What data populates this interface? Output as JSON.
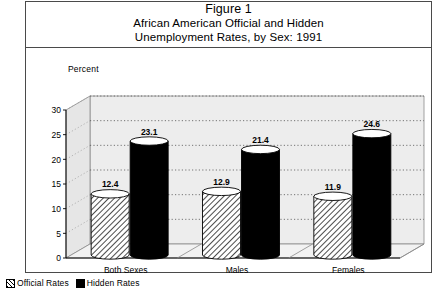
{
  "figure": {
    "title_line1": "Figure 1",
    "title_line2": "African American Official and Hidden",
    "title_line3": "Unemployment Rates, by Sex: 1991"
  },
  "axis": {
    "y_caption": "Percent"
  },
  "legend": {
    "items": [
      {
        "label": "Official Rates",
        "swatch": "hatched-swatch-icon",
        "color": "#000000"
      },
      {
        "label": "Hidden Rates",
        "swatch": "solid-black-swatch-icon",
        "color": "#000000"
      }
    ]
  },
  "chart_data": {
    "type": "bar",
    "title": "African American Official and Hidden Unemployment Rates, by Sex: 1991",
    "categories": [
      "Both Sexes",
      "Males",
      "Females"
    ],
    "series": [
      {
        "name": "Official Rates",
        "values": [
          12.4,
          12.9,
          11.9
        ]
      },
      {
        "name": "Hidden Rates",
        "values": [
          23.1,
          21.4,
          24.6
        ]
      }
    ],
    "xlabel": "",
    "ylabel": "Percent",
    "ylim": [
      0,
      30
    ],
    "yticks": [
      0,
      5,
      10,
      15,
      20,
      25,
      30
    ],
    "ytick_labels": [
      "0",
      "5",
      "10",
      "15",
      "20",
      "25",
      "30"
    ],
    "grid": true,
    "grid_style": "dotted",
    "legend_position": "below-figure",
    "style": "3d-cylinder",
    "data_labels": true
  }
}
